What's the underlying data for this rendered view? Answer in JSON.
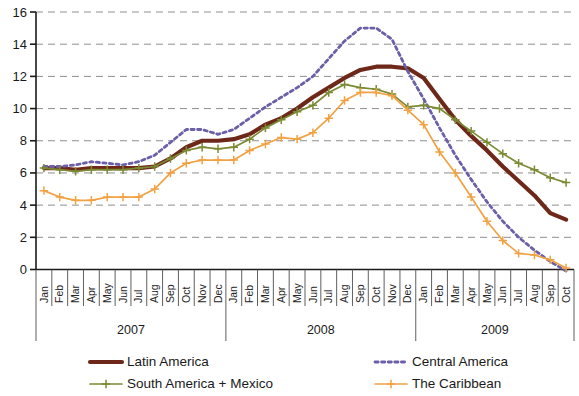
{
  "chart_data": {
    "type": "line",
    "title": "",
    "xlabel": "",
    "ylabel": "",
    "ylim": [
      0,
      16
    ],
    "yticks": [
      0,
      2,
      4,
      6,
      8,
      10,
      12,
      14,
      16
    ],
    "grid": true,
    "legend_position": "bottom",
    "x": [
      "Jan",
      "Feb",
      "Mar",
      "Apr",
      "May",
      "Jun",
      "Jul",
      "Aug",
      "Sep",
      "Oct",
      "Nov",
      "Dec",
      "Jan",
      "Feb",
      "Mar",
      "Apr",
      "May",
      "Jun",
      "Jul",
      "Aug",
      "Sep",
      "Oct",
      "Nov",
      "Dec",
      "Jan",
      "Feb",
      "Mar",
      "Apr",
      "May",
      "Jun",
      "Jul",
      "Aug",
      "Sep",
      "Oct"
    ],
    "x_groups": [
      {
        "label": "2007",
        "start": 0,
        "count": 12
      },
      {
        "label": "2008",
        "start": 12,
        "count": 12
      },
      {
        "label": "2009",
        "start": 24,
        "count": 10
      }
    ],
    "series": [
      {
        "name": "Latin America",
        "color": "#6E2819",
        "style": "solid-thick",
        "marker": "none",
        "values": [
          6.3,
          6.3,
          6.2,
          6.3,
          6.3,
          6.3,
          6.3,
          6.4,
          6.9,
          7.6,
          8.0,
          8.0,
          8.1,
          8.4,
          9.0,
          9.4,
          10.0,
          10.7,
          11.3,
          11.9,
          12.4,
          12.6,
          12.6,
          12.5,
          11.9,
          10.6,
          9.3,
          8.3,
          7.4,
          6.4,
          5.5,
          4.6,
          3.5,
          3.1
        ]
      },
      {
        "name": "Central America",
        "color": "#6B5FA8",
        "style": "dotted",
        "marker": "none",
        "values": [
          6.4,
          6.4,
          6.5,
          6.7,
          6.6,
          6.5,
          6.7,
          7.1,
          7.9,
          8.7,
          8.7,
          8.4,
          8.7,
          9.4,
          10.1,
          10.7,
          11.3,
          12.0,
          13.1,
          14.2,
          15.0,
          15.0,
          14.3,
          12.3,
          10.6,
          8.8,
          7.1,
          5.6,
          4.2,
          3.0,
          2.0,
          1.2,
          0.5,
          -0.1
        ]
      },
      {
        "name": "South America + Mexico",
        "color": "#7B8A33",
        "style": "solid-plus",
        "marker": "plus",
        "values": [
          6.3,
          6.2,
          6.1,
          6.2,
          6.2,
          6.2,
          6.3,
          6.4,
          6.9,
          7.4,
          7.6,
          7.5,
          7.6,
          8.1,
          8.8,
          9.3,
          9.8,
          10.2,
          11.0,
          11.5,
          11.3,
          11.2,
          10.9,
          10.1,
          10.2,
          10.0,
          9.3,
          8.6,
          7.9,
          7.2,
          6.6,
          6.2,
          5.7,
          5.4
        ]
      },
      {
        "name": "The Caribbean",
        "color": "#F0A244",
        "style": "solid-plus",
        "marker": "plus",
        "values": [
          4.9,
          4.5,
          4.3,
          4.3,
          4.5,
          4.5,
          4.5,
          5.0,
          6.0,
          6.6,
          6.8,
          6.8,
          6.8,
          7.4,
          7.8,
          8.2,
          8.1,
          8.5,
          9.4,
          10.5,
          11.0,
          11.0,
          10.8,
          9.9,
          9.0,
          7.3,
          6.0,
          4.5,
          3.0,
          1.8,
          1.0,
          0.9,
          0.6,
          0.1
        ]
      }
    ]
  },
  "legend": {
    "items": [
      {
        "label": "Latin America",
        "key": "latin-america"
      },
      {
        "label": "Central America",
        "key": "central-america"
      },
      {
        "label": "South America + Mexico",
        "key": "south-america-mexico"
      },
      {
        "label": "The Caribbean",
        "key": "the-caribbean"
      }
    ]
  },
  "axis": {
    "y_tick_labels": [
      "16",
      "14",
      "12",
      "10",
      "8",
      "6",
      "4",
      "2",
      "0"
    ]
  }
}
